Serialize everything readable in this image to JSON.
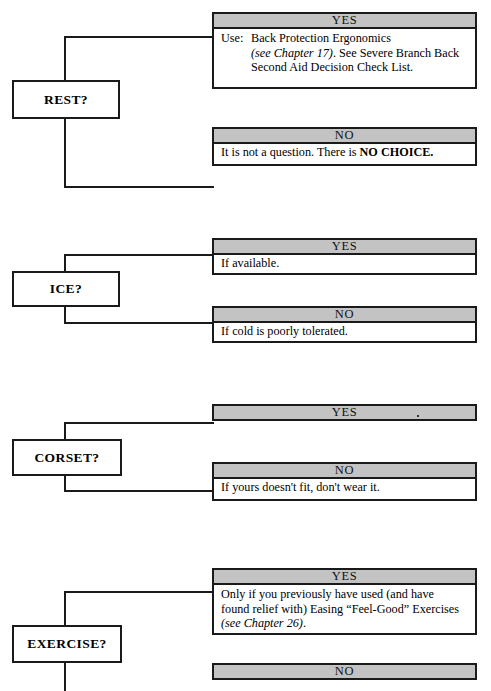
{
  "document": {
    "kind": "decision-flowchart",
    "title": "Back Care Decision Branches"
  },
  "colors": {
    "header_gray": "#c3c3c3",
    "line_black": "#1a1a1a",
    "panel_white": "#ffffff"
  },
  "labels": {
    "yes": "YES",
    "no": "NO"
  },
  "sections": [
    {
      "id": "rest",
      "question": "REST?",
      "yes": {
        "header": "YES",
        "has_body": true,
        "use_label": "Use:",
        "lines": [
          "Back Protection Ergonomics",
          "(see Chapter 17). See Severe Branch Back",
          "Second Aid Decision Check List."
        ],
        "italic_part": "(see Chapter 17)",
        "rest_of_line2": ". See Severe Branch Back"
      },
      "no": {
        "header": "NO",
        "has_body": true,
        "text_plain": "It is not a question. There is ",
        "text_bold": "NO CHOICE."
      }
    },
    {
      "id": "ice",
      "question": "ICE?",
      "yes": {
        "header": "YES",
        "has_body": true,
        "text": "If available."
      },
      "no": {
        "header": "NO",
        "has_body": true,
        "text": "If cold is poorly tolerated."
      }
    },
    {
      "id": "corset",
      "question": "CORSET?",
      "yes": {
        "header": "YES",
        "has_body": false,
        "text": ""
      },
      "no": {
        "header": "NO",
        "has_body": true,
        "text": "If yours doesn't fit, don't wear it."
      }
    },
    {
      "id": "exercise",
      "question": "EXERCISE?",
      "yes": {
        "header": "YES",
        "has_body": true,
        "lines": [
          "Only if you previously have used (and have",
          "found relief with) Easing “Feel-Good” Exercises",
          "(see Chapter 26)."
        ],
        "italic_part": "(see Chapter 26)",
        "trailing": "."
      },
      "no": {
        "header": "NO",
        "has_body": false,
        "text": ""
      }
    }
  ]
}
